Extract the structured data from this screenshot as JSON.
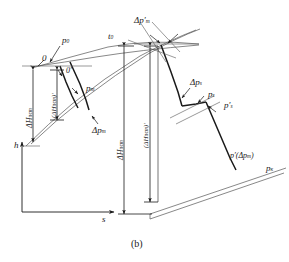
{
  "figure": {
    "caption": "(b)",
    "axes": {
      "y_label": "h",
      "x_label": "s"
    },
    "labels": {
      "point_0": "0",
      "point_0_prime": "0′",
      "p0": "p",
      "p0_sub": "0",
      "t0": "t",
      "t0_sub": "0",
      "pt": "p",
      "pt_sub": "т",
      "delta_pt": "Δp",
      "delta_pt_sub": "т",
      "delta_pt_prime": "Δp′",
      "delta_pt_prime_sub": "т",
      "delta_ps": "Δp",
      "delta_ps_sub": "s",
      "ps": "p",
      "ps_sub": "s",
      "ps_prime": "p′",
      "ps_prime_sub": "s",
      "p_prime_dpt": "p′(Δp",
      "p_prime_dpt_sub": "т",
      "p_prime_dpt_close": ")",
      "pk": "p",
      "pk_sub": "к"
    },
    "dimensions": [
      {
        "name": "delta-H-t-pc-outer-left",
        "base": "ΔH",
        "sup": "пс",
        "sub": "т"
      },
      {
        "name": "delta-H-t-pc-prime-inner-left",
        "base": "(ΔH",
        "sup": "пс",
        "sub": "т",
        "close": ")′"
      },
      {
        "name": "delta-H-t-pc-outer-right",
        "base": "ΔH",
        "sup": "пс",
        "sub": "т"
      },
      {
        "name": "delta-H-t-pc-prime-inner-right",
        "base": "(ΔH",
        "sup": "пс",
        "sub": "т",
        "close": ")′"
      }
    ],
    "colors": {
      "line": "#1a1a1a",
      "thin": "#555555",
      "background": "#ffffff"
    }
  }
}
